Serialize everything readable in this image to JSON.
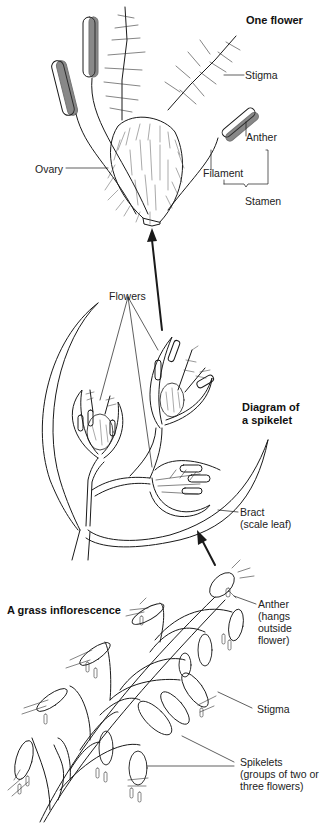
{
  "sections": {
    "one_flower": {
      "title": "One flower",
      "labels": {
        "stigma": "Stigma",
        "anther": "Anther",
        "ovary": "Ovary",
        "filament": "Filament",
        "stamen": "Stamen"
      }
    },
    "spikelet": {
      "title_line1": "Diagram of",
      "title_line2": "a spikelet",
      "labels": {
        "flowers": "Flowers",
        "bract_line1": "Bract",
        "bract_line2": "(scale leaf)"
      }
    },
    "inflorescence": {
      "title": "A grass inflorescence",
      "labels": {
        "anther_line1": "Anther",
        "anther_line2": "(hangs",
        "anther_line3": "outside",
        "anther_line4": "flower)",
        "stigma": "Stigma",
        "spikelets_line1": "Spikelets",
        "spikelets_line2": "(groups of two or",
        "spikelets_line3": "three flowers)"
      }
    }
  },
  "colors": {
    "ink": "#1a1a1a",
    "background": "#ffffff"
  }
}
